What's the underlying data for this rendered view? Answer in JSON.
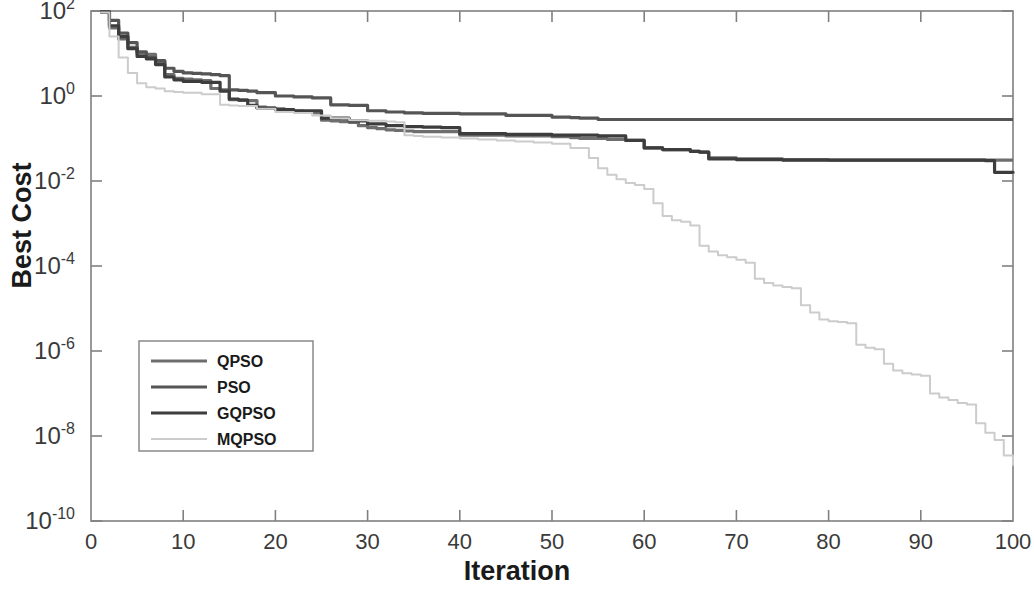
{
  "figure": {
    "background_color": "#ffffff",
    "axes_color": "#808080",
    "xlabel": "Iteration",
    "ylabel": "Best Cost"
  },
  "chart_data": {
    "type": "line",
    "title": "",
    "xlabel": "Iteration",
    "ylabel": "Best Cost",
    "xlim": [
      0,
      100
    ],
    "ylim": [
      1e-10,
      100
    ],
    "yscale": "log",
    "xscale": "linear",
    "grid": false,
    "legend_position": "lower-left-inside",
    "xticks": [
      0,
      10,
      20,
      30,
      40,
      50,
      60,
      70,
      80,
      90,
      100
    ],
    "xtick_labels": [
      "0",
      "10",
      "20",
      "30",
      "40",
      "50",
      "60",
      "70",
      "80",
      "90",
      "100"
    ],
    "yticks": [
      100,
      1,
      0.01,
      0.0001,
      1e-06,
      1e-08,
      1e-10
    ],
    "ytick_labels": [
      "10^2",
      "10^0",
      "10^-2",
      "10^-4",
      "10^-6",
      "10^-8",
      "10^-10"
    ],
    "series": [
      {
        "name": "QPSO",
        "color": "#6e6e6e",
        "linewidth": 3.2,
        "x": [
          1,
          2,
          3,
          4,
          5,
          6,
          7,
          8,
          9,
          10,
          11,
          12,
          13,
          14,
          15,
          16,
          17,
          18,
          19,
          20,
          21,
          22,
          23,
          24,
          25,
          26,
          27,
          28,
          29,
          30,
          31,
          32,
          33,
          34,
          35,
          40,
          45,
          50,
          52,
          53,
          56,
          58,
          60,
          62,
          65,
          66,
          67,
          70,
          75,
          80,
          85,
          90,
          95,
          98,
          100
        ],
        "y": [
          95,
          40,
          22,
          14,
          10,
          9.5,
          6.5,
          3.2,
          2.6,
          2.5,
          2.4,
          2.3,
          1.5,
          1.4,
          0.82,
          0.8,
          0.78,
          0.55,
          0.52,
          0.5,
          0.46,
          0.44,
          0.42,
          0.4,
          0.27,
          0.26,
          0.25,
          0.24,
          0.2,
          0.18,
          0.17,
          0.16,
          0.155,
          0.15,
          0.145,
          0.12,
          0.115,
          0.11,
          0.105,
          0.1,
          0.095,
          0.09,
          0.06,
          0.055,
          0.05,
          0.048,
          0.035,
          0.033,
          0.032,
          0.031,
          0.031,
          0.031,
          0.031,
          0.031,
          0.031
        ]
      },
      {
        "name": "PSO",
        "color": "#555555",
        "linewidth": 3.2,
        "x": [
          1,
          2,
          3,
          4,
          5,
          6,
          7,
          8,
          9,
          10,
          11,
          12,
          13,
          14,
          15,
          16,
          17,
          18,
          20,
          22,
          24,
          26,
          28,
          30,
          32,
          34,
          36,
          40,
          45,
          50,
          52,
          53,
          55,
          60,
          65,
          70,
          75,
          80,
          85,
          90,
          95,
          100
        ],
        "y": [
          96,
          60,
          30,
          18,
          11,
          8,
          6.8,
          4.5,
          3.8,
          3.5,
          3.4,
          3.3,
          3.2,
          3.0,
          1.4,
          1.35,
          1.3,
          1.2,
          1.0,
          0.95,
          0.9,
          0.62,
          0.6,
          0.45,
          0.42,
          0.4,
          0.39,
          0.38,
          0.35,
          0.32,
          0.31,
          0.3,
          0.28,
          0.28,
          0.28,
          0.28,
          0.28,
          0.28,
          0.28,
          0.28,
          0.28,
          0.28
        ]
      },
      {
        "name": "GQPSO",
        "color": "#3d3d3d",
        "linewidth": 3.2,
        "x": [
          1,
          2,
          3,
          4,
          5,
          6,
          7,
          8,
          9,
          10,
          12,
          14,
          15,
          16,
          17,
          18,
          20,
          22,
          25,
          28,
          30,
          32,
          34,
          36,
          38,
          40,
          45,
          50,
          55,
          58,
          60,
          62,
          65,
          66,
          67,
          70,
          75,
          80,
          85,
          90,
          95,
          97,
          98,
          100
        ],
        "y": [
          94,
          45,
          25,
          13,
          8.5,
          7.5,
          5.5,
          2.8,
          2.4,
          2.2,
          2.1,
          1.3,
          0.85,
          0.8,
          0.6,
          0.52,
          0.48,
          0.45,
          0.3,
          0.26,
          0.22,
          0.2,
          0.19,
          0.185,
          0.18,
          0.13,
          0.125,
          0.12,
          0.115,
          0.09,
          0.06,
          0.055,
          0.05,
          0.048,
          0.033,
          0.032,
          0.031,
          0.031,
          0.031,
          0.031,
          0.031,
          0.03,
          0.016,
          0.015
        ]
      },
      {
        "name": "MQPSO",
        "color": "#cccccc",
        "linewidth": 2.0,
        "x": [
          1,
          2,
          3,
          4,
          5,
          6,
          7,
          8,
          9,
          10,
          12,
          14,
          15,
          16,
          18,
          20,
          22,
          24,
          26,
          28,
          30,
          32,
          33,
          34,
          35,
          36,
          38,
          40,
          42,
          44,
          46,
          48,
          50,
          52,
          54,
          55,
          56,
          57,
          58,
          59,
          60,
          61,
          62,
          63,
          64,
          65,
          66,
          67,
          68,
          69,
          70,
          71,
          72,
          73,
          74,
          75,
          76,
          77,
          78,
          79,
          80,
          81,
          82,
          83,
          84,
          85,
          86,
          87,
          88,
          89,
          90,
          91,
          92,
          93,
          94,
          95,
          96,
          97,
          98,
          99,
          100
        ],
        "y": [
          92,
          25,
          8,
          3.5,
          2.0,
          1.6,
          1.5,
          1.3,
          1.25,
          1.2,
          1.1,
          0.62,
          0.6,
          0.58,
          0.5,
          0.42,
          0.4,
          0.35,
          0.3,
          0.27,
          0.26,
          0.25,
          0.24,
          0.12,
          0.115,
          0.11,
          0.105,
          0.1,
          0.095,
          0.09,
          0.085,
          0.08,
          0.075,
          0.06,
          0.035,
          0.02,
          0.014,
          0.011,
          0.009,
          0.008,
          0.0065,
          0.003,
          0.0015,
          0.0012,
          0.0011,
          0.0009,
          0.0003,
          0.00022,
          0.00018,
          0.00016,
          0.00014,
          0.00012,
          5e-05,
          4e-05,
          3.5e-05,
          3.2e-05,
          3e-05,
          1.2e-05,
          8e-06,
          5.5e-06,
          5e-06,
          4.8e-06,
          4.5e-06,
          1.4e-06,
          1.2e-06,
          1.1e-06,
          5e-07,
          3.5e-07,
          3e-07,
          2.8e-07,
          2.6e-07,
          1e-07,
          8e-08,
          7e-08,
          6e-08,
          5.5e-08,
          2e-08,
          1.2e-08,
          8e-09,
          3.5e-09,
          2e-09
        ]
      }
    ]
  },
  "legend": {
    "items": [
      {
        "label": "QPSO",
        "color": "#6e6e6e"
      },
      {
        "label": "PSO",
        "color": "#555555"
      },
      {
        "label": "GQPSO",
        "color": "#3d3d3d"
      },
      {
        "label": "MQPSO",
        "color": "#cccccc"
      }
    ]
  }
}
